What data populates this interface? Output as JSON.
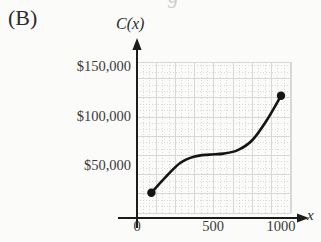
{
  "figure": {
    "panel_label": "(B)",
    "bleed_top_glyphs": [
      "g",
      "____",
      "_"
    ]
  },
  "axes": {
    "y_axis_label": "C(x)",
    "x_axis_label": "x",
    "y_ticks": [
      {
        "label": "$150,000",
        "value": 150000,
        "y_px": 66
      },
      {
        "label": "$100,000",
        "value": 100000,
        "y_px": 116
      },
      {
        "label": "$50,000",
        "value": 50000,
        "y_px": 165
      }
    ],
    "x_ticks": [
      {
        "label": "0",
        "value": 0,
        "x_px": 137
      },
      {
        "label": "500",
        "value": 500,
        "x_px": 213
      },
      {
        "label": "1000",
        "value": 1000,
        "x_px": 281
      }
    ],
    "x_axis_y_px": 218,
    "y_axis_x_px": 137,
    "arrow_color": "#1c1c1c"
  },
  "grid": {
    "left_px": 137,
    "right_px": 291,
    "top_px": 62,
    "bottom_px": 213,
    "major_color": "#d8d8d8",
    "minor_color": "#e8e8e8",
    "dotted_color": "#cccccc",
    "major_step_px": 19.2,
    "minor_per_major": 2
  },
  "chart_data": {
    "type": "line",
    "title": "",
    "subtitle": "",
    "xlabel": "x",
    "ylabel": "C(x)",
    "xlim": [
      0,
      1090
    ],
    "ylim": [
      0,
      180000
    ],
    "grid": true,
    "legend": null,
    "series": [
      {
        "name": "C(x)",
        "curve_shape": "sigmoid / cubic S-curve",
        "line_color": "#141414",
        "line_width_px": 2.6,
        "endpoints_marked": true,
        "marker_color": "#141414",
        "marker_radius_px": 4.2,
        "points": [
          {
            "x": 100,
            "y": 22000
          },
          {
            "x": 200,
            "y": 38000
          },
          {
            "x": 300,
            "y": 52000
          },
          {
            "x": 400,
            "y": 58500
          },
          {
            "x": 500,
            "y": 60500
          },
          {
            "x": 600,
            "y": 61500
          },
          {
            "x": 700,
            "y": 65000
          },
          {
            "x": 800,
            "y": 75000
          },
          {
            "x": 900,
            "y": 95000
          },
          {
            "x": 1000,
            "y": 120000
          }
        ],
        "endpoint_start": {
          "x": 100,
          "y": 22000,
          "px": [
            143,
            196
          ]
        },
        "endpoint_end": {
          "x": 1000,
          "y": 120000,
          "px": [
            280,
            96
          ]
        }
      }
    ],
    "annotations": [
      {
        "text": "(B)",
        "role": "panel-label",
        "px": [
          12,
          18
        ]
      }
    ]
  }
}
